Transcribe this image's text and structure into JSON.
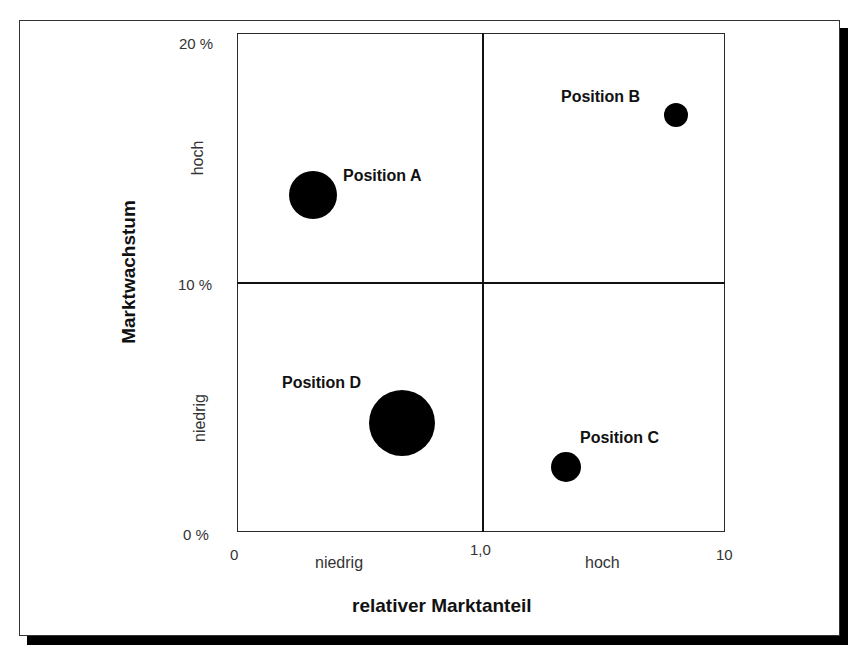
{
  "chart_data": {
    "type": "scatter",
    "subtype": "bubble-portfolio-matrix",
    "title": "",
    "xlabel": "relativer Marktanteil",
    "ylabel": "Marktwachstum",
    "x_ticks": [
      "0",
      "1,0",
      "10"
    ],
    "y_ticks": [
      "0 %",
      "10 %",
      "20 %"
    ],
    "x_scale": "log",
    "xlim": [
      0,
      10
    ],
    "ylim": [
      0,
      20
    ],
    "x_categories": [
      "niedrig",
      "hoch"
    ],
    "y_categories": [
      "niedrig",
      "hoch"
    ],
    "quadrant_divider": {
      "x": 1.0,
      "y": 10
    },
    "grid": false,
    "series": [
      {
        "name": "Position A",
        "x": 0.3,
        "y": 13.5,
        "size": "large"
      },
      {
        "name": "Position B",
        "x": 7.5,
        "y": 16.8,
        "size": "small"
      },
      {
        "name": "Position C",
        "x": 2.0,
        "y": 2.6,
        "size": "small-medium"
      },
      {
        "name": "Position D",
        "x": 0.6,
        "y": 4.4,
        "size": "very-large"
      }
    ]
  },
  "axes": {
    "x_title": "relativer Marktanteil",
    "y_title": "Marktwachstum",
    "x_ticks": {
      "min": "0",
      "mid": "1,0",
      "max": "10"
    },
    "y_ticks": {
      "min": "0 %",
      "mid": "10 %",
      "max": "20 %"
    },
    "x_low": "niedrig",
    "x_high": "hoch",
    "y_low": "niedrig",
    "y_high": "hoch"
  },
  "positions": [
    {
      "label": "Position A",
      "cx": 313,
      "cy": 195,
      "r": 24,
      "lx": 343,
      "ly": 168
    },
    {
      "label": "Position B",
      "cx": 676,
      "cy": 115,
      "r": 12,
      "lx": 561,
      "ly": 89
    },
    {
      "label": "Position C",
      "cx": 566,
      "cy": 467,
      "r": 15,
      "lx": 580,
      "ly": 430
    },
    {
      "label": "Position D",
      "cx": 402,
      "cy": 423,
      "r": 33,
      "lx": 282,
      "ly": 375
    }
  ]
}
